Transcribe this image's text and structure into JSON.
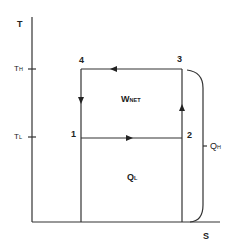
{
  "diagram": {
    "type": "T-S diagram (Carnot refrigeration cycle)",
    "axes": {
      "y_label": "T",
      "x_label": "S",
      "y_ticks": [
        {
          "main": "T",
          "sub": "H"
        },
        {
          "main": "T",
          "sub": "L"
        }
      ]
    },
    "states": [
      "1",
      "2",
      "3",
      "4"
    ],
    "regions": {
      "work": {
        "main": "W",
        "sub": "NET"
      },
      "heat_low": {
        "main": "Q",
        "sub": "L"
      },
      "heat_high": {
        "main": "Q",
        "sub": "H"
      }
    },
    "processes": [
      {
        "from": "1",
        "to": "2",
        "direction": "right"
      },
      {
        "from": "2",
        "to": "3",
        "direction": "up"
      },
      {
        "from": "3",
        "to": "4",
        "direction": "left"
      },
      {
        "from": "4",
        "to": "1",
        "direction": "down"
      }
    ],
    "colors": {
      "line": "#333333",
      "background": "#ffffff"
    }
  }
}
